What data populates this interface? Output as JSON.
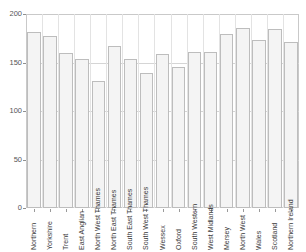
{
  "chart_data": {
    "type": "bar",
    "title": "",
    "xlabel": "",
    "ylabel": "",
    "ylim": [
      0,
      200
    ],
    "yticks": [
      0,
      50,
      100,
      150,
      200
    ],
    "ytick_labels": [
      "0",
      "50",
      "100",
      "150",
      "200"
    ],
    "grid": true,
    "legend": "none",
    "categories": [
      "Northern",
      "Yorkshire",
      "Trent",
      "East Anglian",
      "North West Thames",
      "North East Thames",
      "South East Thames",
      "South West Thames",
      "Wessex",
      "Oxford",
      "South Western",
      "West Midlands",
      "Mersey",
      "North West",
      "Wales",
      "Scotland",
      "Northern Ireland"
    ],
    "values": [
      181,
      177,
      160,
      154,
      131,
      167,
      154,
      139,
      159,
      145,
      161,
      161,
      179,
      186,
      173,
      185,
      171
    ],
    "bar_fill_color": "#f4f4f4",
    "bar_edge_color": "#bdbdbd",
    "axis_color": "#c9c9c9",
    "grid_color": "#d5d5d5",
    "text_color": "#3a3a3a"
  }
}
